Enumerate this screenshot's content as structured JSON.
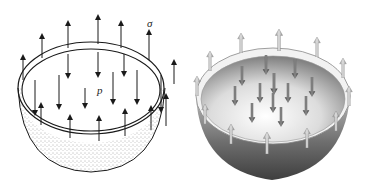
{
  "figure": {
    "left": {
      "title": "Line-drawing hemisphere under internal pressure",
      "labels": {
        "stress": "σ",
        "pressure": "p"
      },
      "colors": {
        "stroke": "#1a1a1a",
        "stipple": "#555555"
      }
    },
    "right": {
      "title": "Shaded hemisphere under internal pressure",
      "colors": {
        "shell_dark": "#4a4a4a",
        "shell_light": "#bdbdbd",
        "inner_light": "#f4f4f4",
        "inner_dark": "#8a8a8a",
        "pressure_arrow": "#555555",
        "stress_arrow": "#c8c8c8"
      }
    }
  }
}
